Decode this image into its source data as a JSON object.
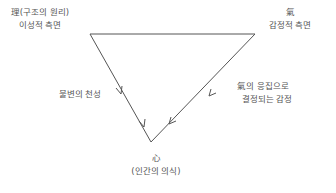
{
  "diagram": {
    "type": "triangle-flow",
    "nodes": {
      "top_left": {
        "line1": "理(구조의 원리)",
        "line2": "이성적 측면"
      },
      "top_right": {
        "line1": "氣",
        "line2": "감정적 측면"
      },
      "bottom": {
        "line1": "心",
        "line2": "(인간의 의식)"
      }
    },
    "edges": {
      "left": {
        "label": "불변의 천성",
        "from": "top_left",
        "to": "bottom"
      },
      "right": {
        "label_line1": "氣의 응집으로",
        "label_line2": "결정되는 감정",
        "from": "top_right",
        "to": "bottom"
      },
      "top": {
        "from": "top_left",
        "to": "top_right"
      }
    },
    "colors": {
      "line": "#555555",
      "text": "#555555",
      "background": "#ffffff"
    }
  }
}
